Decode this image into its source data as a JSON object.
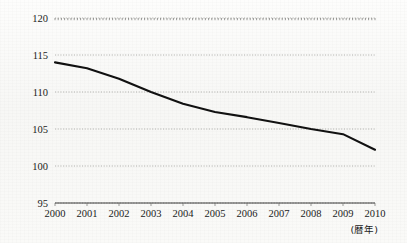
{
  "chart_data": {
    "type": "line",
    "title": "",
    "subtitle": "",
    "xlabel": "",
    "ylabel": "",
    "x_axis_caption": "(暦年)",
    "categories": [
      "2000",
      "2001",
      "2002",
      "2003",
      "2004",
      "2005",
      "2006",
      "2007",
      "2008",
      "2009",
      "2010"
    ],
    "x": [
      2000,
      2001,
      2002,
      2003,
      2004,
      2005,
      2006,
      2007,
      2008,
      2009,
      2010
    ],
    "values": [
      114.0,
      113.2,
      111.8,
      110.0,
      108.4,
      107.3,
      106.6,
      105.8,
      105.0,
      104.3,
      102.2
    ],
    "series": [
      {
        "name": "",
        "values": [
          114.0,
          113.2,
          111.8,
          110.0,
          108.4,
          107.3,
          106.6,
          105.8,
          105.0,
          104.3,
          102.2
        ]
      }
    ],
    "ylim": [
      95,
      120
    ],
    "xlim": [
      2000,
      2010
    ],
    "y_ticks": [
      95,
      100,
      105,
      110,
      115,
      120
    ],
    "y_tick_labels": [
      "95",
      "100",
      "105",
      "110",
      "115",
      "120"
    ],
    "x_ticks": [
      2000,
      2001,
      2002,
      2003,
      2004,
      2005,
      2006,
      2007,
      2008,
      2009,
      2010
    ],
    "x_tick_labels": [
      "2000",
      "2001",
      "2002",
      "2003",
      "2004",
      "2005",
      "2006",
      "2007",
      "2008",
      "2009",
      "2010"
    ],
    "grid": true,
    "grid_axis": "y",
    "legend": false,
    "legend_position": "none",
    "annotations": [],
    "line_color": "#111111",
    "grid_color": "#9a9a96",
    "background_color": "#fbfbfa"
  }
}
